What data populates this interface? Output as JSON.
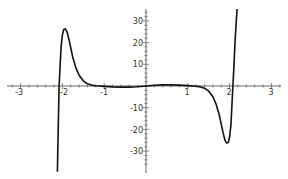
{
  "chart_data": {
    "type": "line",
    "title": "",
    "xlabel": "",
    "ylabel": "",
    "xlim": [
      -3.3,
      3.2
    ],
    "ylim": [
      -39.5,
      35.5
    ],
    "grid": false,
    "legend": null,
    "x_ticks": [
      -3,
      -2,
      -1,
      1,
      2,
      3
    ],
    "x_tick_labels": [
      "-3",
      "-2",
      "-1",
      "1",
      "2",
      "3"
    ],
    "y_ticks": [
      -30,
      -20,
      -10,
      10,
      20,
      30
    ],
    "y_tick_labels": [
      "-30",
      "-20",
      "-10",
      "10",
      "20",
      "30"
    ],
    "x_minor_step": 0.2,
    "y_minor_step": 2,
    "series": [
      {
        "name": "f(x)",
        "color": "#111111",
        "x": [
          -2.12,
          -2.1,
          -2.08,
          -2.05,
          -2.03,
          -2.0,
          -1.97,
          -1.93,
          -1.89,
          -1.85,
          -1.8,
          -1.75,
          -1.68,
          -1.6,
          -1.5,
          -1.4,
          -1.3,
          -1.2,
          -1.0,
          -0.8,
          -0.6,
          -0.4,
          -0.2,
          0.0,
          0.2,
          0.4,
          0.6,
          0.8,
          1.0,
          1.2,
          1.3,
          1.4,
          1.5,
          1.6,
          1.68,
          1.75,
          1.8,
          1.85,
          1.89,
          1.93,
          1.97,
          2.0,
          2.03,
          2.05,
          2.08,
          2.1,
          2.13,
          2.16,
          2.18
        ],
        "y": [
          -39.5,
          -20,
          0,
          11,
          18,
          23.5,
          26,
          26.3,
          25,
          22,
          17.5,
          13,
          8.5,
          5,
          2.4,
          1,
          0.4,
          0.1,
          -0.2,
          -0.4,
          -0.5,
          -0.5,
          -0.3,
          0,
          0.3,
          0.5,
          0.5,
          0.4,
          0.2,
          -0.1,
          -0.4,
          -1,
          -2.4,
          -5,
          -8.5,
          -13,
          -17.5,
          -22,
          -25,
          -26.3,
          -26,
          -23.5,
          -18,
          -11,
          0,
          8,
          20,
          30,
          35.5
        ]
      }
    ]
  }
}
